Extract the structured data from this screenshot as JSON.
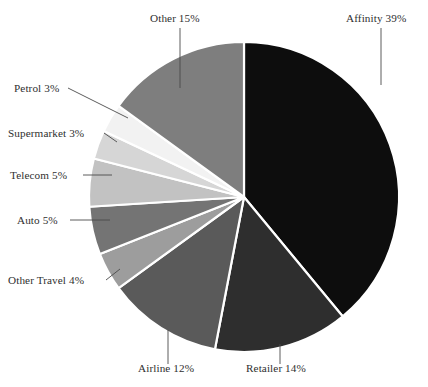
{
  "chart_data": {
    "type": "pie",
    "title": "",
    "subtitle": "",
    "xlabel": "",
    "ylabel": "",
    "legend_position": "none",
    "grid": false,
    "units": "percent",
    "total": 100,
    "start_angle_deg": 0,
    "direction": "clockwise",
    "categories": [
      "Affinity",
      "Retailer",
      "Airline",
      "Other Travel",
      "Auto",
      "Telecom",
      "Supermarket",
      "Petrol",
      "Other"
    ],
    "values": [
      39,
      14,
      12,
      4,
      5,
      5,
      3,
      3,
      15
    ],
    "slices": [
      {
        "name": "Affinity",
        "value": 39,
        "label": "Affinity 39%",
        "color": "#0d0d0d",
        "label_x": 346,
        "label_y": 22,
        "label_anchor": "start",
        "leader": "M 381 28 L 381 85"
      },
      {
        "name": "Retailer",
        "value": 14,
        "label": "Retailer 14%",
        "color": "#2e2e2e",
        "label_x": 246,
        "label_y": 372,
        "label_anchor": "start",
        "leader": "M 280 344 L 280 364"
      },
      {
        "name": "Airline",
        "value": 12,
        "label": "Airline 12%",
        "color": "#5a5a5a",
        "label_x": 138,
        "label_y": 372,
        "label_anchor": "start",
        "leader": "M 168 330 L 168 364"
      },
      {
        "name": "Other Travel",
        "value": 4,
        "label": "Other Travel 4%",
        "color": "#9d9d9d",
        "label_x": 8,
        "label_y": 284,
        "label_anchor": "start",
        "leader": "M 106 280 L 120 269"
      },
      {
        "name": "Auto",
        "value": 5,
        "label": "Auto 5%",
        "color": "#747474",
        "label_x": 17,
        "label_y": 224,
        "label_anchor": "start",
        "leader": "M 70 220 L 110 220"
      },
      {
        "name": "Telecom",
        "value": 5,
        "label": "Telecom 5%",
        "color": "#c2c2c2",
        "label_x": 10,
        "label_y": 179,
        "label_anchor": "start",
        "leader": "M 83 175 L 112 175"
      },
      {
        "name": "Supermarket",
        "value": 3,
        "label": "Supermarket 3%",
        "color": "#d6d6d6",
        "label_x": 8,
        "label_y": 137,
        "label_anchor": "start",
        "leader": "M 104 133 L 117 142"
      },
      {
        "name": "Petrol",
        "value": 3,
        "label": "Petrol 3%",
        "color": "#f2f2f2",
        "label_x": 14,
        "label_y": 92,
        "label_anchor": "start",
        "leader": "M 68 88 L 128 118"
      },
      {
        "name": "Other",
        "value": 15,
        "label": "Other 15%",
        "color": "#7e7e7e",
        "label_x": 150,
        "label_y": 22,
        "label_anchor": "start",
        "leader": "M 180 28 L 180 88"
      }
    ],
    "geometry": {
      "center_x": 244,
      "center_y": 197,
      "radius": 155,
      "separator_color": "#ffffff",
      "background_color": "#ffffff"
    }
  }
}
